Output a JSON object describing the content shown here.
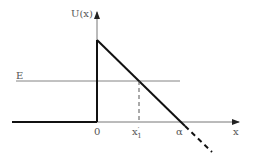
{
  "diagram": {
    "y_axis_label": "U(x)",
    "x_axis_label": "x",
    "energy_label": "E",
    "origin_label": "0",
    "turning_point_label": "x'1",
    "turning_point_main": "x",
    "turning_point_prime": "′",
    "turning_point_sub": "1",
    "zero_crossing_label": "α",
    "colors": {
      "curve": "#111111",
      "axis": "#444444",
      "energy_line": "#666666",
      "text": "#555555"
    }
  }
}
